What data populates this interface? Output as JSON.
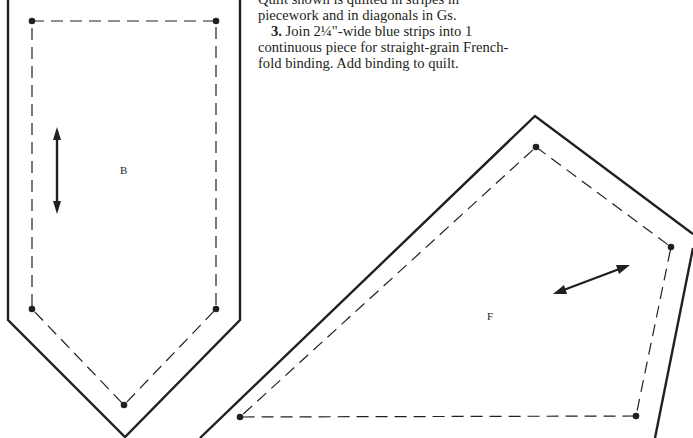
{
  "instructions": {
    "line1": "Quilt shown is quilted in stripes in",
    "line2": "piecework and in diagonals in Gs.",
    "step3_number": "3.",
    "step3_text": " Join 2¼\"-wide blue strips into 1 continuous piece for straight-grain French-fold binding. Add binding to quilt."
  },
  "pieces": [
    {
      "label": "B",
      "grain_arrow": "vertical",
      "outer_outline": [
        [
          8,
          0
        ],
        [
          8,
          320
        ],
        [
          125,
          437
        ],
        [
          240,
          320
        ],
        [
          240,
          0
        ]
      ],
      "seam_points": [
        [
          32,
          21
        ],
        [
          216,
          21
        ],
        [
          216,
          309
        ],
        [
          124,
          405
        ],
        [
          32,
          309
        ]
      ]
    },
    {
      "label": "F",
      "grain_arrow": "diagonal",
      "outer_outline": [
        [
          200,
          438
        ],
        [
          535,
          116
        ],
        [
          693,
          234
        ],
        [
          693,
          248
        ],
        [
          655,
          438
        ]
      ],
      "seam_points": [
        [
          536,
          147
        ],
        [
          671,
          247
        ],
        [
          636,
          416
        ],
        [
          240,
          417
        ]
      ]
    }
  ],
  "colors": {
    "ink": "#231f20",
    "background": "#ffffff"
  }
}
